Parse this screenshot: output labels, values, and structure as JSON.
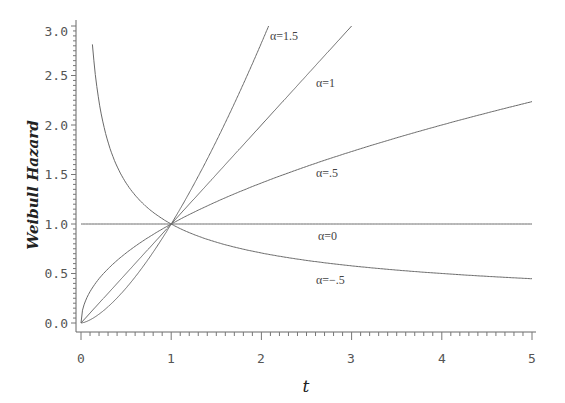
{
  "chart_data": {
    "type": "line",
    "title": "",
    "xlabel": "t",
    "ylabel": "Weibull Hazard",
    "xlim": [
      0,
      5
    ],
    "ylim": [
      0,
      3.0
    ],
    "x_ticks": [
      "0",
      "1",
      "2",
      "3",
      "4",
      "5"
    ],
    "y_ticks": [
      "0.0",
      "0.5",
      "1.0",
      "1.5",
      "2.0",
      "2.5",
      "3.0"
    ],
    "grid": false,
    "legend": "inline curve labels",
    "formula": "h(t) = t^alpha",
    "series": [
      {
        "name": "α=1.5",
        "alpha": 1.5,
        "label": "α=1.5",
        "x": [
          0,
          0.5,
          1,
          1.5,
          2.08
        ],
        "y": [
          0,
          0.35,
          1.0,
          1.84,
          3.0
        ]
      },
      {
        "name": "α=1",
        "alpha": 1,
        "label": "α=1",
        "x": [
          0,
          1,
          2,
          3
        ],
        "y": [
          0,
          1,
          2,
          3
        ]
      },
      {
        "name": "α=.5",
        "alpha": 0.5,
        "label": "α=.5",
        "x": [
          0,
          0.25,
          1,
          2,
          3,
          4,
          5
        ],
        "y": [
          0,
          0.5,
          1,
          1.41,
          1.73,
          2.0,
          2.24
        ]
      },
      {
        "name": "α=0",
        "alpha": 0,
        "label": "α=0",
        "x": [
          0,
          5
        ],
        "y": [
          1,
          1
        ]
      },
      {
        "name": "α=-.5",
        "alpha": -0.5,
        "label": "α=−.5",
        "x": [
          0.11,
          0.25,
          0.5,
          1,
          2,
          3,
          4,
          5
        ],
        "y": [
          3.0,
          2.0,
          1.41,
          1.0,
          0.71,
          0.58,
          0.5,
          0.45
        ]
      }
    ]
  },
  "axes": {
    "x_title": "t",
    "y_title": "Weibull Hazard"
  },
  "labels": {
    "a15": "α=1.5",
    "a1": "α=1",
    "a05": "α=.5",
    "a0": "α=0",
    "am05": "α=−.5"
  },
  "ticks": {
    "x": [
      "0",
      "1",
      "2",
      "3",
      "4",
      "5"
    ],
    "y": [
      "0.0",
      "0.5",
      "1.0",
      "1.5",
      "2.0",
      "2.5",
      "3.0"
    ]
  }
}
